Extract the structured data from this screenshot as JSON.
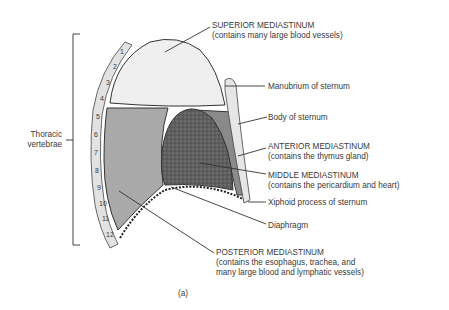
{
  "figure": {
    "caption": "(a)",
    "colors": {
      "superior": "#efefef",
      "posterior": "#a9a9a9",
      "anterior": "#8a8a8a",
      "middle": "#5e5e5e",
      "sternum": "#e6e6e6",
      "vertebra": "#e2e2e2",
      "line": "#2e2e2e"
    }
  },
  "labels": {
    "thoracic": {
      "line1": "Thoracic",
      "line2": "vertebrae"
    },
    "superior": {
      "title": "SUPERIOR MEDIASTINUM",
      "note": "(contains many large blood vessels)"
    },
    "manubrium": "Manubrium of sternum",
    "body_sternum": "Body of sternum",
    "anterior": {
      "title": "ANTERIOR MEDIASTINUM",
      "note": "(contains the thymus gland)"
    },
    "middle": {
      "title": "MIDDLE MEDIASTINUM",
      "note": "(contains the pericardium and heart)"
    },
    "xiphoid": "Xiphoid process of sternum",
    "diaphragm": "Diaphragm",
    "posterior": {
      "title": "POSTERIOR MEDIASTINUM",
      "line2": "(contains the esophagus, trachea, and",
      "line3": "many large blood and lymphatic vessels)"
    }
  },
  "vertebrae": [
    "1",
    "2",
    "3",
    "4",
    "5",
    "6",
    "7",
    "8",
    "9",
    "10",
    "11",
    "12"
  ]
}
